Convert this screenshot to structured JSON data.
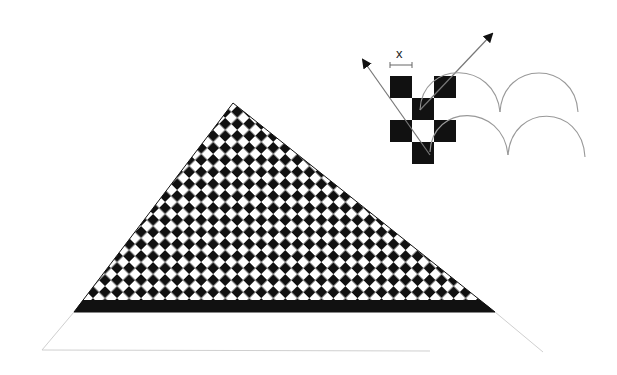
{
  "diagram": {
    "title": "",
    "inset": {
      "label": "x",
      "description": "4x3 checker tile motif with two direction arrows and repeating arc rows"
    },
    "colors": {
      "ink": "#111111",
      "line": "#8a8a8a",
      "faint_line": "#c8c8c8",
      "background": "#ffffff"
    },
    "triangle": {
      "apex": [
        233,
        103
      ],
      "base_left": [
        74,
        312
      ],
      "base_right": [
        495,
        312
      ],
      "base_band_top": 300,
      "pattern": "diagonal checkerboard",
      "cell_size": 12
    },
    "ground": {
      "left": [
        42,
        350
      ],
      "right": [
        543,
        352
      ]
    }
  }
}
